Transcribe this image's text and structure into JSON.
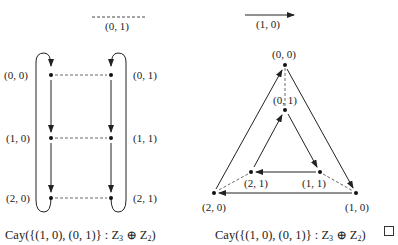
{
  "legend": {
    "dashed_generator": "(0, 1)",
    "solid_generator": "(1, 0)"
  },
  "left_graph": {
    "nodes": [
      {
        "id": "00",
        "label": "(0, 0)"
      },
      {
        "id": "01",
        "label": "(0, 1)"
      },
      {
        "id": "10",
        "label": "(1, 0)"
      },
      {
        "id": "11",
        "label": "(1, 1)"
      },
      {
        "id": "20",
        "label": "(2, 0)"
      },
      {
        "id": "21",
        "label": "(2, 1)"
      }
    ],
    "caption": {
      "prefix": "Cay({(1, 0), (0, 1)} : Z",
      "sub1": "3",
      "oplus": " ⊕ Z",
      "sub2": "2",
      "suffix": ")"
    }
  },
  "right_graph": {
    "nodes": [
      {
        "id": "00",
        "label": "(0, 0)"
      },
      {
        "id": "01",
        "label": "(0, 1)"
      },
      {
        "id": "10",
        "label": "(1, 0)"
      },
      {
        "id": "11",
        "label": "(1, 1)"
      },
      {
        "id": "20",
        "label": "(2, 0)"
      },
      {
        "id": "21",
        "label": "(2, 1)"
      }
    ],
    "caption": {
      "prefix": "Cay({(1, 0), (0, 1)} : Z",
      "sub1": "3",
      "oplus": " ⊕ Z",
      "sub2": "2",
      "suffix": ")"
    }
  },
  "end_of_proof_symbol": "qed-square"
}
